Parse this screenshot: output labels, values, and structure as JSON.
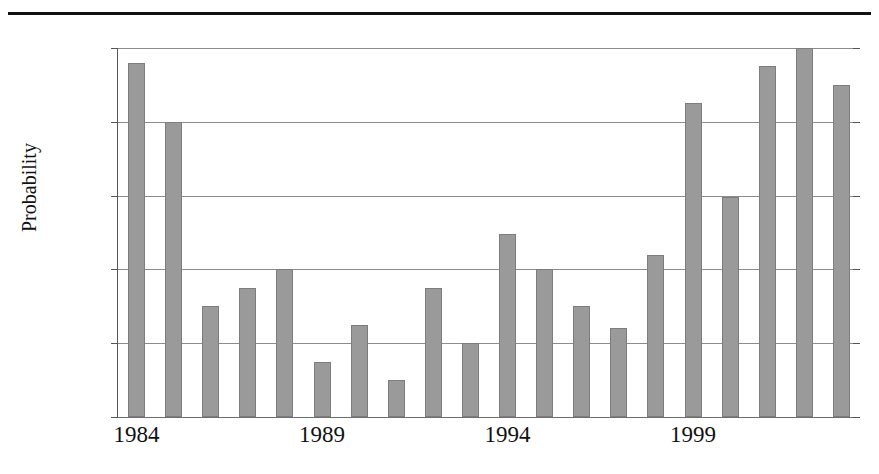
{
  "chart_data": {
    "type": "bar",
    "title": "",
    "xlabel": "",
    "ylabel": "Probability",
    "ylim": [
      0,
      20
    ],
    "ytick_labels": [
      "20%",
      "16%",
      "12%",
      "8%",
      "4%",
      "0%"
    ],
    "ytick_values": [
      20,
      16,
      12,
      8,
      4,
      0
    ],
    "grid": true,
    "legend": "none",
    "categories": [
      "1984",
      "1985",
      "1986",
      "1987",
      "1988",
      "1989",
      "1990",
      "1991",
      "1992",
      "1993",
      "1994",
      "1995",
      "1996",
      "1997",
      "1998",
      "1999",
      "2000",
      "2001",
      "2002",
      "2003"
    ],
    "xtick_labels": [
      "1984",
      "1989",
      "1994",
      "1999"
    ],
    "xtick_categories": [
      "1984",
      "1989",
      "1994",
      "1999"
    ],
    "values": [
      19.2,
      16.0,
      6.0,
      7.0,
      8.0,
      3.0,
      5.0,
      2.0,
      7.0,
      4.0,
      9.9,
      8.0,
      6.0,
      4.8,
      8.8,
      17.0,
      11.9,
      19.0,
      20.0,
      18.0
    ],
    "units": "percent",
    "bar_color": "#9a9a9a",
    "bar_edge_color": "#7d7d7d",
    "grid_color": "#8c8c8c",
    "axis_color": "#555555",
    "rule_color": "#111111",
    "text_color": "#111111"
  }
}
